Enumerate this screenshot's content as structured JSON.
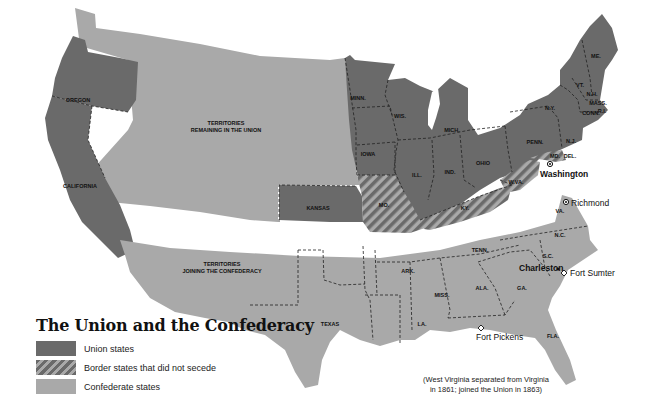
{
  "legend": {
    "title": "The Union and the Confederacy",
    "items": [
      {
        "label": "Union states",
        "pattern": "solid-dark",
        "color": "#6a6a6a"
      },
      {
        "label": "Border states that did not secede",
        "pattern": "hatched",
        "color": "#6a6a6a"
      },
      {
        "label": "Confederate states",
        "pattern": "solid-light",
        "color": "#a9a9a9"
      }
    ]
  },
  "regions": {
    "territories_union": "TERRITORIES",
    "territories_union_2": "REMAINING IN THE UNION",
    "territories_conf": "TERRITORIES",
    "territories_conf_2": "JOINING THE CONFEDERACY"
  },
  "union_states": [
    "OREGON",
    "CALIFORNIA",
    "KANSAS",
    "MINN.",
    "IOWA",
    "WIS.",
    "MICH.",
    "ILL.",
    "IND.",
    "OHIO",
    "PENN.",
    "N.Y.",
    "N.J.",
    "VT.",
    "N.H.",
    "ME.",
    "MASS.",
    "CONN.",
    "R.I."
  ],
  "border_states": [
    "MO.",
    "KY.",
    "W.VA.",
    "MD.",
    "DEL."
  ],
  "confederate_states": [
    "TEXAS",
    "ARK.",
    "LA.",
    "MISS.",
    "ALA.",
    "TENN.",
    "GA.",
    "FLA.",
    "S.C.",
    "N.C.",
    "VA."
  ],
  "places": {
    "washington": "Washington",
    "richmond": "Richmond",
    "charleston": "Charleston",
    "fort_sumter": "Fort Sumter",
    "fort_pickens": "Fort Pickens"
  },
  "note": {
    "line1": "(West Virginia separated from Virginia",
    "line2": "in 1861; joined the Union in 1863)"
  },
  "colors": {
    "union": "#6a6a6a",
    "confederate": "#a9a9a9",
    "background": "#ffffff"
  }
}
